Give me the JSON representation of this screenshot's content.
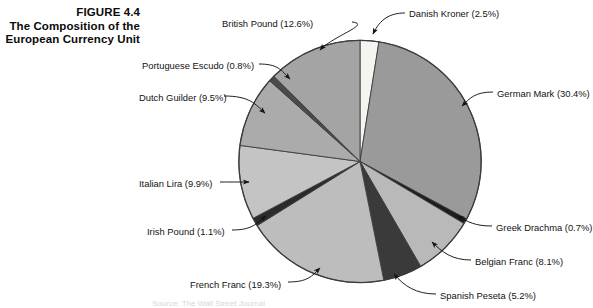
{
  "figure": {
    "number_line": "FIGURE 4.4",
    "title_line_1": "The Composition of the",
    "title_line_2": "European Currency Unit",
    "source_note": "Source: The Wall Street Journal"
  },
  "chart_data": {
    "type": "pie",
    "title": "The Composition of the European Currency Unit",
    "xlabel": "",
    "ylabel": "",
    "legend_position": "callout-labels",
    "grid": false,
    "start_angle_deg": 0,
    "direction": "clockwise",
    "categories": [
      "Danish Kroner",
      "German Mark",
      "Greek Drachma",
      "Belgian Franc",
      "Spanish Peseta",
      "French Franc",
      "Irish Pound",
      "Italian Lira",
      "Dutch Guilder",
      "Portuguese Escudo",
      "British Pound"
    ],
    "values": [
      2.5,
      30.4,
      0.7,
      8.1,
      5.2,
      19.3,
      1.1,
      9.9,
      9.5,
      0.8,
      12.6
    ],
    "slices": [
      {
        "name": "Danish Kroner",
        "value": 2.5,
        "label": "Danish Kroner (2.5%)",
        "color": "#f4f4f0"
      },
      {
        "name": "German Mark",
        "value": 30.4,
        "label": "German Mark (30.4%)",
        "color": "#9a9a9a"
      },
      {
        "name": "Greek Drachma",
        "value": 0.7,
        "label": "Greek Drachma (0.7%)",
        "color": "#1d1d1d"
      },
      {
        "name": "Belgian Franc",
        "value": 8.1,
        "label": "Belgian Franc (8.1%)",
        "color": "#b9b9b9"
      },
      {
        "name": "Spanish Peseta",
        "value": 5.2,
        "label": "Spanish Peseta (5.2%)",
        "color": "#3a3a3a"
      },
      {
        "name": "French Franc",
        "value": 19.3,
        "label": "French Franc (19.3%)",
        "color": "#bdbdbd"
      },
      {
        "name": "Irish Pound",
        "value": 1.1,
        "label": "Irish Pound (1.1%)",
        "color": "#2b2b2b"
      },
      {
        "name": "Italian Lira",
        "value": 9.9,
        "label": "Italian Lira (9.9%)",
        "color": "#c4c4c4"
      },
      {
        "name": "Dutch Guilder",
        "value": 9.5,
        "label": "Dutch Guilder (9.5%)",
        "color": "#ababab"
      },
      {
        "name": "Portuguese Escudo",
        "value": 0.8,
        "label": "Portuguese Escudo (0.8%)",
        "color": "#4a4a4a"
      },
      {
        "name": "British Pound",
        "value": 12.6,
        "label": "British Pound (12.6%)",
        "color": "#a4a4a4"
      }
    ]
  },
  "colors": {
    "background": "#ffffff",
    "text": "#121212",
    "outline": "#3d3d3d"
  }
}
